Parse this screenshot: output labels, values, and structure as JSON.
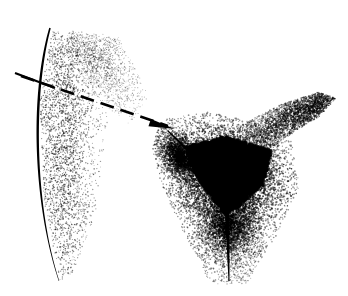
{
  "figure": {
    "domain": "Diagram",
    "alt_text": "Black and white stipple-shaded medical line drawing showing a curved contour on the left with a short crossing tick mark, a dashed leader line terminating in a solid arrowhead aimed at a shaded fold, and a dense triangular stippled mass with a vertical cleft descending from its apex.",
    "width": 348,
    "height": 296,
    "background_color": "#ffffff",
    "ink_color": "#000000",
    "style": "stipple"
  },
  "elements": {
    "contour_curve": {
      "name": "left-contour-curve",
      "description": "Thick tapered curved contour line running from upper area down to lower left",
      "start": [
        50,
        28
      ],
      "control_1": [
        31,
        96
      ],
      "control_2": [
        34,
        205
      ],
      "end": [
        59,
        281
      ],
      "stroke_width_max": 3.4,
      "stroke_width_min": 1.1
    },
    "tick_line": {
      "name": "cross-tick-mark",
      "description": "Short straight line crossing the contour curve",
      "start": [
        15,
        73
      ],
      "end": [
        55,
        88
      ],
      "stroke_width": 2.2
    },
    "leader_line": {
      "name": "dashed-leader-line",
      "description": "Dashed pointer line running down-right toward the arrowhead",
      "start": [
        21,
        76
      ],
      "end": [
        168,
        126
      ],
      "stroke_width": 2.6,
      "dash_pattern": "14 7"
    },
    "arrowhead": {
      "name": "arrowhead-pointer",
      "description": "Solid filled triangular arrowhead at the terminus of the dashed leader",
      "tip": [
        175,
        129
      ],
      "angle_deg": 19,
      "length": 26,
      "half_width": 6
    },
    "cleft_line": {
      "name": "vertical-cleft-line",
      "description": "Tapered vertical dark line descending from apex of the dense triangular mass",
      "start": [
        227,
        205
      ],
      "end": [
        229,
        281
      ],
      "stroke_width_top": 5.0,
      "stroke_width_bottom": 1.0
    },
    "fold_line": {
      "name": "upper-fold-line",
      "description": "Short dark fold stroke beneath the arrowhead",
      "start": [
        168,
        131
      ],
      "end": [
        196,
        158
      ],
      "stroke_width": 3.0
    }
  },
  "stipple_fields": [
    {
      "name": "left-thigh-shading",
      "description": "Light stipple band hugging the right side of the contour curve",
      "seed": 101,
      "count": 2600,
      "polygon": [
        [
          52,
          30
        ],
        [
          92,
          42
        ],
        [
          108,
          120
        ],
        [
          96,
          210
        ],
        [
          74,
          275
        ],
        [
          60,
          280
        ],
        [
          44,
          200
        ],
        [
          40,
          100
        ]
      ],
      "density_axis": "x",
      "edge_soft": 0.62,
      "dot_min": 0.45,
      "dot_max": 1.1,
      "opacity": 0.85
    },
    {
      "name": "upper-left-diffuse-band",
      "description": "Faint diagonal stipple haze from the upper left toward center",
      "seed": 202,
      "count": 1400,
      "polygon": [
        [
          68,
          30
        ],
        [
          118,
          36
        ],
        [
          150,
          96
        ],
        [
          132,
          126
        ],
        [
          92,
          96
        ],
        [
          64,
          52
        ]
      ],
      "density_axis": "diag",
      "edge_soft": 0.8,
      "dot_min": 0.4,
      "dot_max": 0.9,
      "opacity": 0.6
    },
    {
      "name": "right-upper-sweep",
      "description": "Stipple sweep arcing up to the right from the central mass",
      "seed": 303,
      "count": 3200,
      "polygon": [
        [
          236,
          128
        ],
        [
          276,
          106
        ],
        [
          318,
          92
        ],
        [
          336,
          98
        ],
        [
          320,
          116
        ],
        [
          282,
          140
        ],
        [
          250,
          164
        ]
      ],
      "density_axis": "x-rev",
      "edge_soft": 0.72,
      "dot_min": 0.5,
      "dot_max": 1.2,
      "opacity": 0.85
    },
    {
      "name": "central-mound-halo",
      "description": "Medium-density stipple halo surrounding the dense triangular mass",
      "seed": 404,
      "count": 9000,
      "polygon": [
        [
          160,
          120
        ],
        [
          206,
          112
        ],
        [
          250,
          120
        ],
        [
          292,
          142
        ],
        [
          300,
          186
        ],
        [
          276,
          236
        ],
        [
          246,
          282
        ],
        [
          216,
          284
        ],
        [
          186,
          238
        ],
        [
          162,
          186
        ],
        [
          152,
          148
        ]
      ],
      "density_axis": "radial",
      "center": [
        226,
        176
      ],
      "edge_soft": 0.55,
      "dot_min": 0.55,
      "dot_max": 1.35,
      "opacity": 0.92
    },
    {
      "name": "dense-triangular-mass",
      "description": "Very dense near-solid stippled inverted triangle",
      "seed": 505,
      "count": 14000,
      "polygon": [
        [
          186,
          146
        ],
        [
          226,
          136
        ],
        [
          272,
          150
        ],
        [
          264,
          184
        ],
        [
          238,
          208
        ],
        [
          224,
          214
        ],
        [
          206,
          192
        ],
        [
          190,
          166
        ]
      ],
      "density_axis": "solid",
      "edge_soft": 0.3,
      "dot_min": 1.0,
      "dot_max": 2.3,
      "opacity": 1.0
    },
    {
      "name": "lower-cleft-shading",
      "description": "Stipple shading flanking the descending vertical cleft line",
      "seed": 606,
      "count": 3000,
      "polygon": [
        [
          198,
          206
        ],
        [
          258,
          206
        ],
        [
          266,
          248
        ],
        [
          248,
          284
        ],
        [
          210,
          284
        ],
        [
          194,
          248
        ]
      ],
      "density_axis": "radial",
      "center": [
        228,
        222
      ],
      "edge_soft": 0.62,
      "dot_min": 0.5,
      "dot_max": 1.1,
      "opacity": 0.82
    },
    {
      "name": "left-fold-shading",
      "description": "Stipple shading along the fold below the arrowhead",
      "seed": 707,
      "count": 2200,
      "polygon": [
        [
          158,
          126
        ],
        [
          186,
          134
        ],
        [
          206,
          166
        ],
        [
          196,
          192
        ],
        [
          172,
          176
        ],
        [
          152,
          150
        ]
      ],
      "density_axis": "radial",
      "center": [
        182,
        156
      ],
      "edge_soft": 0.58,
      "dot_min": 0.55,
      "dot_max": 1.25,
      "opacity": 0.9
    }
  ],
  "labels": {
    "figure_caption": ""
  }
}
